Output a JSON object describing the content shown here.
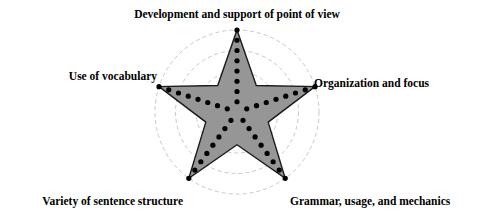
{
  "chart_data": {
    "type": "radar",
    "title": "",
    "subtitle": "",
    "xlabel": "",
    "ylabel": "",
    "categories": [
      "Development and support of point of view",
      "Organization and focus",
      "Grammar, usage, and mechanics",
      "Variety of sentence structure",
      "Use of vocabulary"
    ],
    "series": [
      {
        "name": "Score",
        "values": [
          8,
          8,
          8,
          8,
          8
        ]
      }
    ],
    "inner_values": [
      2,
      2,
      2,
      2,
      2
    ],
    "rlim": [
      0,
      8
    ],
    "tick_count": 8,
    "grid": true,
    "grid_rings": 4,
    "legend": "none",
    "start_angle_deg": 90,
    "annotations": []
  },
  "chart": {
    "center_x": 237,
    "center_y": 112,
    "outer_radius": 82,
    "inner_radius_ratio": 0.4,
    "dot_radius": 2.6,
    "ring_radii": [
      20.5,
      41,
      61.5,
      82
    ],
    "labels": {
      "top": "Development and support of point of view",
      "right": "Organization and focus",
      "bottom_right": "Grammar, usage, and mechanics",
      "bottom_left": "Variety of sentence structure",
      "left": "Use of vocabulary"
    }
  },
  "colors": {
    "background": "#ffffff",
    "star_fill": "#969696",
    "star_stroke": "#1a1a1a",
    "grid_stroke": "#c8c8c8",
    "axis_stroke": "#555555",
    "dot_fill": "#000000",
    "label_text": "#000000"
  }
}
